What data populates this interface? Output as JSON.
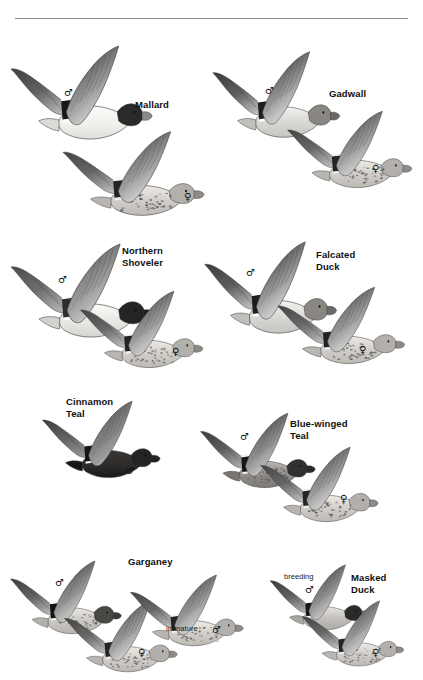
{
  "page": {
    "kind": "field-guide-plate",
    "background_color": "#ffffff",
    "rule_color": "#8d8d8d",
    "ink_color": "#101010"
  },
  "symbols": {
    "male": "♂",
    "female": "♀"
  },
  "groups": [
    {
      "id": "mallard",
      "label": "Mallard",
      "label_x": 135,
      "label_y": 99,
      "birds": [
        {
          "id": "mallard-male",
          "sex": "♂",
          "sex_x": 64,
          "sex_y": 88,
          "x": 8,
          "y": 42,
          "w": 150,
          "h": 100,
          "tone": "male-mallard"
        },
        {
          "id": "mallard-female",
          "sex": "♀",
          "sex_x": 184,
          "sex_y": 192,
          "x": 60,
          "y": 128,
          "w": 150,
          "h": 90,
          "tone": "female-mottled"
        }
      ]
    },
    {
      "id": "gadwall",
      "label": "Gadwall",
      "label_x": 329,
      "label_y": 88,
      "birds": [
        {
          "id": "gadwall-male",
          "sex": "♂",
          "sex_x": 265,
          "sex_y": 86,
          "x": 210,
          "y": 48,
          "w": 135,
          "h": 92,
          "tone": "male-gray"
        },
        {
          "id": "gadwall-female",
          "sex": "♀",
          "sex_x": 372,
          "sex_y": 164,
          "x": 285,
          "y": 108,
          "w": 132,
          "h": 82,
          "tone": "female-mottled"
        }
      ]
    },
    {
      "id": "northern-shoveler",
      "label": "Northern\nShoveler",
      "label_x": 122,
      "label_y": 245,
      "birds": [
        {
          "id": "shoveler-male",
          "sex": "♂",
          "sex_x": 58,
          "sex_y": 275,
          "x": 8,
          "y": 240,
          "w": 152,
          "h": 100,
          "tone": "male-shoveler"
        },
        {
          "id": "shoveler-female",
          "sex": "♀",
          "sex_x": 172,
          "sex_y": 347,
          "x": 78,
          "y": 288,
          "w": 130,
          "h": 82,
          "tone": "female-mottled"
        }
      ]
    },
    {
      "id": "falcated-duck",
      "label": "Falcated\nDuck",
      "label_x": 316,
      "label_y": 249,
      "birds": [
        {
          "id": "falcated-male",
          "sex": "♂",
          "sex_x": 246,
          "sex_y": 268,
          "x": 202,
          "y": 238,
          "w": 140,
          "h": 98,
          "tone": "male-gray"
        },
        {
          "id": "falcated-female",
          "sex": "♀",
          "sex_x": 359,
          "sex_y": 345,
          "x": 275,
          "y": 284,
          "w": 135,
          "h": 82,
          "tone": "female-mottled"
        }
      ]
    },
    {
      "id": "cinnamon-teal",
      "label": "Cinnamon\nTeal",
      "label_x": 66,
      "label_y": 396,
      "birds": [
        {
          "id": "cinnamon-male",
          "sex": "♂",
          "sex_x": 126,
          "sex_y": 466,
          "x": 40,
          "y": 398,
          "w": 125,
          "h": 82,
          "tone": "male-cinnamon"
        }
      ]
    },
    {
      "id": "blue-winged-teal",
      "label": "Blue-winged\nTeal",
      "label_x": 290,
      "label_y": 418,
      "birds": [
        {
          "id": "bwteal-male",
          "sex": "♂",
          "sex_x": 240,
          "sex_y": 432,
          "x": 198,
          "y": 410,
          "w": 122,
          "h": 80,
          "tone": "male-bwteal"
        },
        {
          "id": "bwteal-female",
          "sex": "♀",
          "sex_x": 340,
          "sex_y": 494,
          "x": 258,
          "y": 444,
          "w": 125,
          "h": 80,
          "tone": "female-mottled"
        }
      ]
    },
    {
      "id": "garganey",
      "label": "Garganey",
      "label_x": 128,
      "label_y": 556,
      "birds": [
        {
          "id": "garganey-male",
          "sex": "♂",
          "sex_x": 55,
          "sex_y": 578,
          "x": 8,
          "y": 558,
          "w": 118,
          "h": 78,
          "tone": "male-garganey"
        },
        {
          "id": "garganey-female",
          "sex": "♀",
          "sex_x": 138,
          "sex_y": 648,
          "x": 62,
          "y": 598,
          "w": 120,
          "h": 76,
          "tone": "female-mottled"
        },
        {
          "id": "garganey-immature",
          "sex": "♂",
          "sex_x": 212,
          "sex_y": 625,
          "x": 128,
          "y": 572,
          "w": 120,
          "h": 76,
          "tone": "female-mottled"
        }
      ],
      "annotations": [
        {
          "id": "garganey-immature-label",
          "text": "immature",
          "x": 166,
          "y": 624
        }
      ]
    },
    {
      "id": "masked-duck",
      "label": "Masked\nDuck",
      "label_x": 351,
      "label_y": 572,
      "birds": [
        {
          "id": "masked-breeding-male",
          "sex": "♂",
          "sex_x": 305,
          "sex_y": 585,
          "x": 268,
          "y": 562,
          "w": 105,
          "h": 70,
          "tone": "male-masked"
        },
        {
          "id": "masked-female",
          "sex": "♀",
          "sex_x": 372,
          "sex_y": 648,
          "x": 300,
          "y": 598,
          "w": 108,
          "h": 70,
          "tone": "female-mottled"
        }
      ],
      "annotations": [
        {
          "id": "masked-breeding-label",
          "text": "breeding",
          "x": 284,
          "y": 572
        }
      ]
    }
  ]
}
